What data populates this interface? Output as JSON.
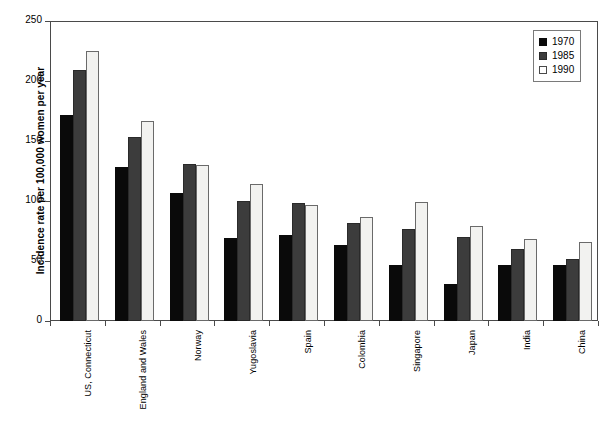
{
  "chart_data": {
    "type": "bar",
    "title": "",
    "subtitle": "",
    "xlabel": "",
    "ylabel": "Incidence rate per 100,000 women per year",
    "ylim": [
      0,
      250
    ],
    "yticks": [
      0,
      50,
      100,
      150,
      200,
      250
    ],
    "grid": false,
    "legend_position": "top-right",
    "categories": [
      "US, Connecticut",
      "England and Wales",
      "Norway",
      "Yugoslavia",
      "Spain",
      "Colombia",
      "Singapore",
      "Japan",
      "India",
      "China"
    ],
    "series": [
      {
        "name": "1970",
        "color": "#0a0a0a",
        "values": [
          172,
          128,
          107,
          69,
          72,
          63,
          47,
          31,
          47,
          47
        ]
      },
      {
        "name": "1985",
        "color": "#3c3c3c",
        "values": [
          209,
          153,
          131,
          100,
          98,
          82,
          77,
          70,
          60,
          52
        ]
      },
      {
        "name": "1990",
        "color": "#f2f2f0",
        "values": [
          225,
          167,
          130,
          114,
          97,
          87,
          99,
          79,
          68,
          66
        ]
      }
    ]
  }
}
